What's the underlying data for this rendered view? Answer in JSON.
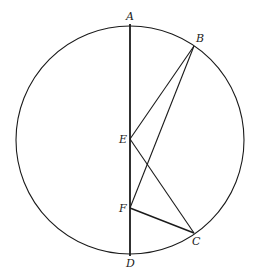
{
  "diagram": {
    "type": "geometry",
    "circle": {
      "cx": 130,
      "cy": 140,
      "r": 114
    },
    "points": {
      "A": {
        "x": 130,
        "y": 24,
        "label": "A"
      },
      "B": {
        "x": 194,
        "y": 46,
        "label": "B"
      },
      "C": {
        "x": 194,
        "y": 233,
        "label": "C"
      },
      "D": {
        "x": 130,
        "y": 256,
        "label": "D"
      },
      "E": {
        "x": 130,
        "y": 139,
        "label": "E"
      },
      "F": {
        "x": 130,
        "y": 208,
        "label": "F"
      }
    },
    "segments": [
      {
        "from": "A",
        "to": "D"
      },
      {
        "from": "E",
        "to": "B"
      },
      {
        "from": "F",
        "to": "B"
      },
      {
        "from": "E",
        "to": "C"
      },
      {
        "from": "F",
        "to": "C"
      }
    ],
    "labels": {
      "A": "A",
      "B": "B",
      "C": "C",
      "D": "D",
      "E": "E",
      "F": "F"
    },
    "colors": {
      "line": "#1a1a1a",
      "background": "#ffffff"
    }
  }
}
